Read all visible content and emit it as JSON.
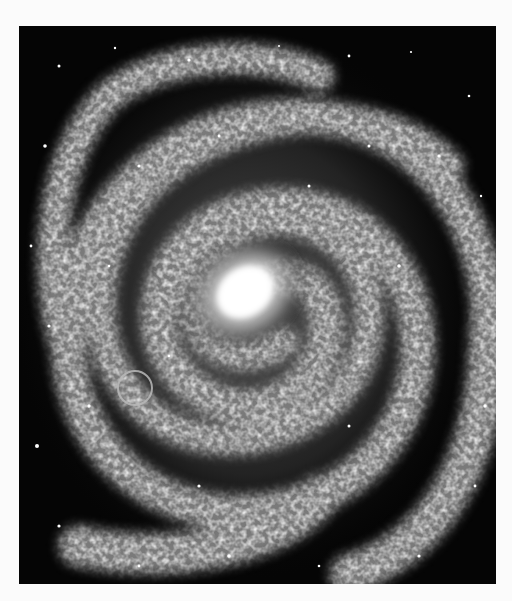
{
  "image": {
    "subject": "spiral galaxy illustration",
    "palette": {
      "background": "#fbfbfb",
      "space": "#050505",
      "core": "#ffffff",
      "arms": "#bdbdbd"
    },
    "frame": {
      "x": 19,
      "y": 26,
      "width": 477,
      "height": 558
    },
    "core_center": {
      "x": 245,
      "y": 290
    },
    "marker": {
      "shape": "circle",
      "x": 135,
      "y": 388,
      "radius": 17
    }
  }
}
